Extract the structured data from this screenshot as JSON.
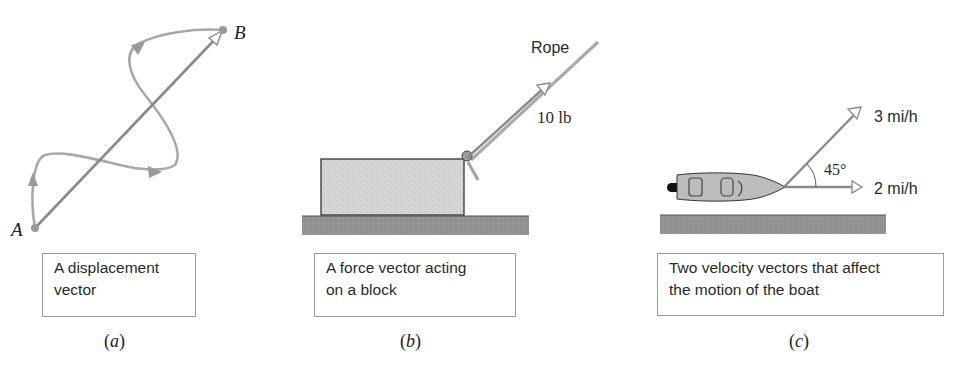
{
  "figure": {
    "panels": [
      {
        "id": "a",
        "label_open": "(",
        "label_letter": "a",
        "label_close": ")",
        "caption_lines": [
          "A displacement",
          "vector"
        ],
        "points": {
          "start": "A",
          "end": "B"
        }
      },
      {
        "id": "b",
        "label_open": "(",
        "label_letter": "b",
        "label_close": ")",
        "caption_lines": [
          "A force vector acting",
          "on a block"
        ],
        "rope_label": "Rope",
        "force_label": "10 lb"
      },
      {
        "id": "c",
        "label_open": "(",
        "label_letter": "c",
        "label_close": ")",
        "caption_lines": [
          "Two velocity vectors that affect",
          "the motion of the boat"
        ],
        "vectors": [
          {
            "label": "3 mi/h",
            "angle_deg": 45
          },
          {
            "label": "2 mi/h",
            "angle_deg": 0
          }
        ],
        "angle_label": "45°"
      }
    ],
    "colors": {
      "vector": "#8a8a8a",
      "path": "#a8a8a8",
      "block_fill": "#d4d4d4",
      "ground_fill": "#8f8f8f",
      "boat_fill": "#b9b9b9",
      "text": "#2a2a2a"
    }
  }
}
